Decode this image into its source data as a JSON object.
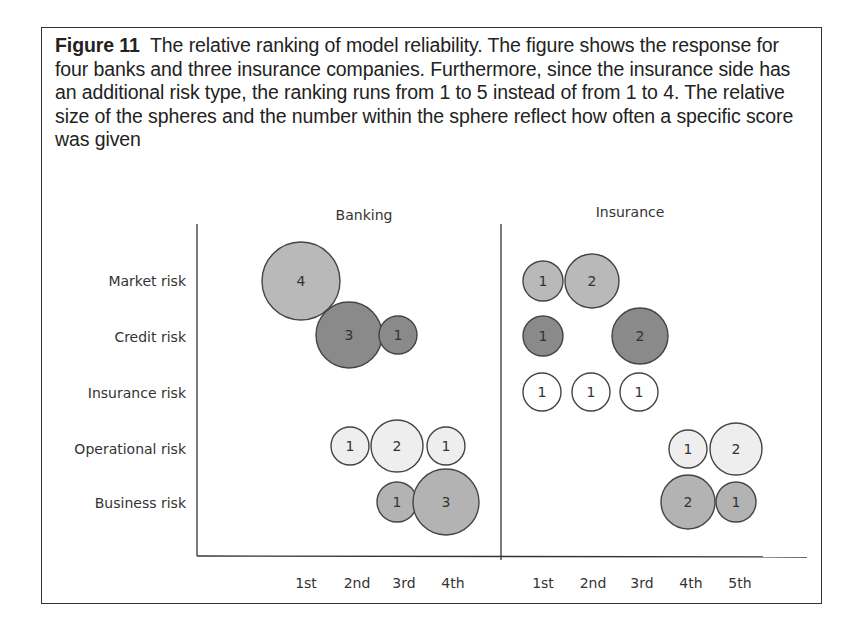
{
  "caption": {
    "label": "Figure 11",
    "text": "The relative ranking of model reliability. The figure shows the response for four banks and three insurance companies. Furthermore, since the insurance side has an additional risk type, the ranking runs from 1 to 5 instead of from 1 to 4. The relative size of the spheres and the number within the sphere reflect how often a specific score was given"
  },
  "colors": {
    "market": "#b9b9b9",
    "credit": "#8a8a8a",
    "insurance": "#ffffff",
    "operational": "#eeeeee",
    "business": "#b3b3b3",
    "stroke": "#444444"
  },
  "chart_data": {
    "type": "bubble",
    "title": "The relative ranking of model reliability",
    "panels": [
      "Banking",
      "Insurance"
    ],
    "rows": [
      "Market risk",
      "Credit risk",
      "Insurance risk",
      "Operational risk",
      "Business risk"
    ],
    "banking_ranks": [
      "1st",
      "2nd",
      "3rd",
      "4th"
    ],
    "insurance_ranks": [
      "1st",
      "2nd",
      "3rd",
      "4th",
      "5th"
    ],
    "banking": {
      "Market risk": {
        "1st": 4
      },
      "Credit risk": {
        "2nd": 3,
        "3rd": 1
      },
      "Insurance risk": {},
      "Operational risk": {
        "2nd": 1,
        "3rd": 2,
        "4th": 1
      },
      "Business risk": {
        "3rd": 1,
        "4th": 3
      }
    },
    "insurance": {
      "Market risk": {
        "1st": 1,
        "2nd": 2
      },
      "Credit risk": {
        "1st": 1,
        "3rd": 2
      },
      "Insurance risk": {
        "1st": 1,
        "2nd": 1,
        "3rd": 1
      },
      "Operational risk": {
        "4th": 1,
        "5th": 2
      },
      "Business risk": {
        "4th": 2,
        "5th": 1
      }
    },
    "bubbles": [
      {
        "panel": "Banking",
        "row": "Market risk",
        "x": 301,
        "y": 281,
        "r": 39,
        "value": "4",
        "fill": "market"
      },
      {
        "panel": "Banking",
        "row": "Credit risk",
        "x": 349,
        "y": 335,
        "r": 33,
        "value": "3",
        "fill": "credit"
      },
      {
        "panel": "Banking",
        "row": "Credit risk",
        "x": 398,
        "y": 335,
        "r": 19,
        "value": "1",
        "fill": "credit"
      },
      {
        "panel": "Banking",
        "row": "Operational risk",
        "x": 350,
        "y": 446,
        "r": 19,
        "value": "1",
        "fill": "operational"
      },
      {
        "panel": "Banking",
        "row": "Operational risk",
        "x": 397,
        "y": 446,
        "r": 26,
        "value": "2",
        "fill": "operational"
      },
      {
        "panel": "Banking",
        "row": "Operational risk",
        "x": 446,
        "y": 446,
        "r": 19,
        "value": "1",
        "fill": "operational"
      },
      {
        "panel": "Banking",
        "row": "Business risk",
        "x": 397,
        "y": 502,
        "r": 20,
        "value": "1",
        "fill": "business"
      },
      {
        "panel": "Banking",
        "row": "Business risk",
        "x": 446,
        "y": 502,
        "r": 33,
        "value": "3",
        "fill": "business"
      },
      {
        "panel": "Insurance",
        "row": "Market risk",
        "x": 543,
        "y": 281,
        "r": 20,
        "value": "1",
        "fill": "market"
      },
      {
        "panel": "Insurance",
        "row": "Market risk",
        "x": 592,
        "y": 281,
        "r": 27,
        "value": "2",
        "fill": "market"
      },
      {
        "panel": "Insurance",
        "row": "Credit risk",
        "x": 543,
        "y": 336,
        "r": 20,
        "value": "1",
        "fill": "credit"
      },
      {
        "panel": "Insurance",
        "row": "Credit risk",
        "x": 640,
        "y": 336,
        "r": 28,
        "value": "2",
        "fill": "credit"
      },
      {
        "panel": "Insurance",
        "row": "Insurance risk",
        "x": 542,
        "y": 392,
        "r": 19,
        "value": "1",
        "fill": "insurance"
      },
      {
        "panel": "Insurance",
        "row": "Insurance risk",
        "x": 591,
        "y": 392,
        "r": 19,
        "value": "1",
        "fill": "insurance"
      },
      {
        "panel": "Insurance",
        "row": "Insurance risk",
        "x": 639,
        "y": 392,
        "r": 19,
        "value": "1",
        "fill": "insurance"
      },
      {
        "panel": "Insurance",
        "row": "Operational risk",
        "x": 688,
        "y": 449,
        "r": 19,
        "value": "1",
        "fill": "operational"
      },
      {
        "panel": "Insurance",
        "row": "Operational risk",
        "x": 736,
        "y": 449,
        "r": 26,
        "value": "2",
        "fill": "operational"
      },
      {
        "panel": "Insurance",
        "row": "Business risk",
        "x": 688,
        "y": 502,
        "r": 27,
        "value": "2",
        "fill": "business"
      },
      {
        "panel": "Insurance",
        "row": "Business risk",
        "x": 736,
        "y": 502,
        "r": 20,
        "value": "1",
        "fill": "business"
      }
    ],
    "row_y": [
      281,
      336,
      392,
      448,
      502
    ],
    "banking_x": [
      306,
      357,
      403,
      453
    ],
    "insurance_x": [
      545,
      593,
      642,
      691,
      740
    ],
    "xlabel": "",
    "ylabel": ""
  }
}
